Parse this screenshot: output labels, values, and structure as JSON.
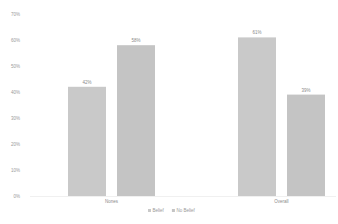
{
  "chart_data": {
    "type": "bar",
    "title": "",
    "xlabel": "",
    "ylabel": "",
    "categories": [
      "Nones",
      "Overall"
    ],
    "series": [
      {
        "name": "Belief",
        "values": [
          42,
          61
        ],
        "labels": [
          "42%",
          "61%"
        ],
        "color": "#c9c9c9"
      },
      {
        "name": "No Belief",
        "values": [
          58,
          39
        ],
        "labels": [
          "58%",
          "39%"
        ],
        "color": "#c4c4c4"
      }
    ],
    "ylim": [
      0,
      70
    ],
    "yticks": [
      0,
      10,
      20,
      30,
      40,
      50,
      60,
      70
    ],
    "ytick_labels": [
      "0%",
      "10%",
      "20%",
      "30%",
      "40%",
      "50%",
      "60%",
      "70%"
    ],
    "grid": false,
    "legend": {
      "position": "bottom-center",
      "entries": [
        "Belief",
        "No Belief"
      ]
    }
  }
}
